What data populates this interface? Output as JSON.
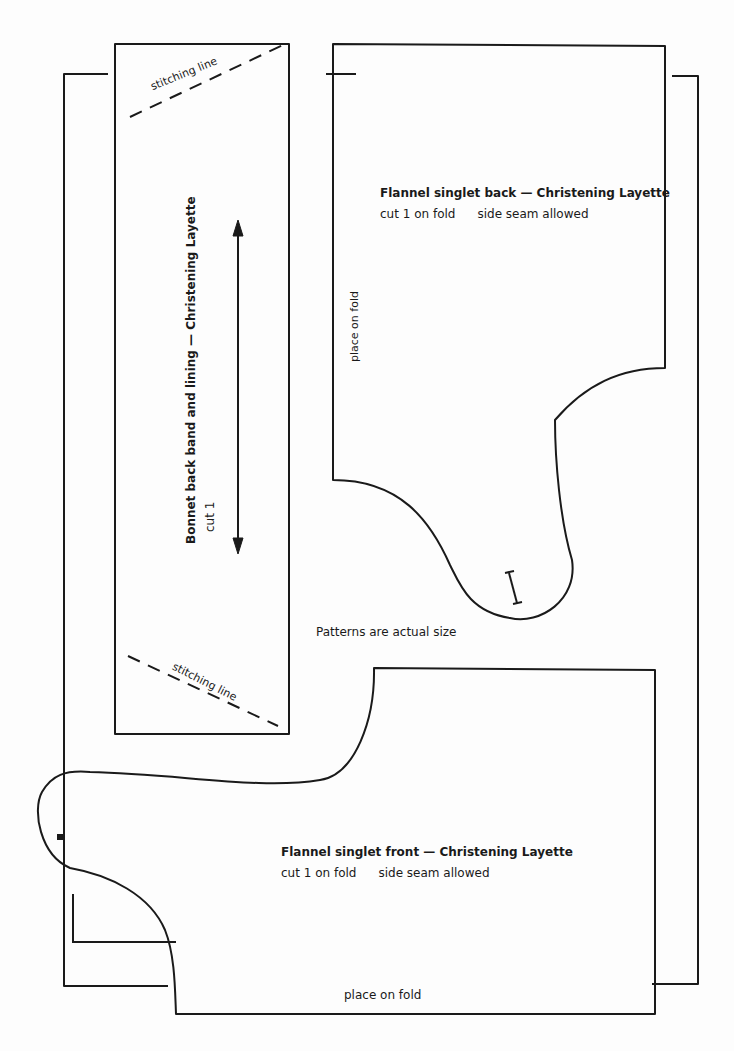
{
  "page": {
    "note": "Patterns are actual size",
    "background": "#fdfdfd",
    "line_color": "#1a1a1a"
  },
  "bonnet_band": {
    "title": "Bonnet back band and lining — Christening Layette",
    "instruction": "cut 1",
    "stitching_top": "stitching line",
    "stitching_bottom": "stitching line",
    "grainline_icon": "double-arrow"
  },
  "singlet_back": {
    "title": "Flannel singlet back — Christening Layette",
    "cut": "cut 1 on fold",
    "seam": "side seam allowed",
    "fold_label": "place on fold",
    "marker_icon": "I-notch"
  },
  "singlet_front": {
    "title": "Flannel singlet front — Christening Layette",
    "cut": "cut 1 on fold",
    "seam": "side seam allowed",
    "fold_label": "place on fold",
    "marker_icon": "square-dot"
  }
}
